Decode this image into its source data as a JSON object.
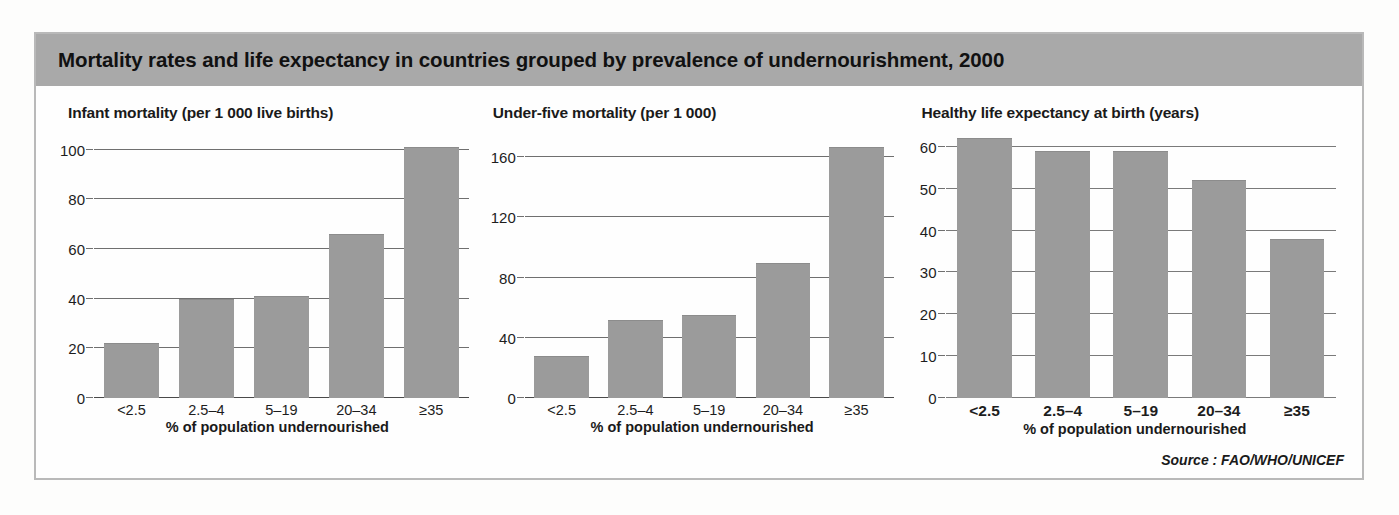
{
  "figure": {
    "title": "Mortality rates and life expectancy in countries grouped by prevalence of undernourishment, 2000",
    "source": "Source : FAO/WHO/UNICEF",
    "header_bg": "#a9a9a9",
    "bar_color": "#9b9b9b",
    "border_color": "#b9b9b9"
  },
  "chart_data": [
    {
      "type": "bar",
      "title": "Infant mortality (per 1 000 live births)",
      "xlabel": "% of population undernourished",
      "ylabel": "",
      "categories": [
        "<2.5",
        "2.5–4",
        "5–19",
        "20–34",
        "≥35"
      ],
      "values": [
        22,
        40,
        41,
        66,
        101
      ],
      "yticks": [
        0,
        20,
        40,
        60,
        80,
        100
      ],
      "ylim": [
        0,
        108
      ],
      "grid": true,
      "legend": "none"
    },
    {
      "type": "bar",
      "title": "Under-five mortality (per 1 000)",
      "xlabel": "% of population undernourished",
      "ylabel": "",
      "categories": [
        "<2.5",
        "2.5–4",
        "5–19",
        "20–34",
        "≥35"
      ],
      "values": [
        28,
        52,
        55,
        90,
        167
      ],
      "yticks": [
        0,
        40,
        80,
        120,
        160
      ],
      "ylim": [
        0,
        178
      ],
      "grid": true,
      "legend": "none"
    },
    {
      "type": "bar",
      "title": "Healthy life expectancy at birth (years)",
      "xlabel": "% of population undernourished",
      "ylabel": "",
      "categories": [
        "<2.5",
        "2.5–4",
        "5–19",
        "20–34",
        "≥35"
      ],
      "values": [
        62,
        59,
        59,
        52,
        38
      ],
      "yticks": [
        0,
        10,
        20,
        30,
        40,
        50,
        60
      ],
      "ylim": [
        0,
        64
      ],
      "grid": true,
      "legend": "none"
    }
  ]
}
